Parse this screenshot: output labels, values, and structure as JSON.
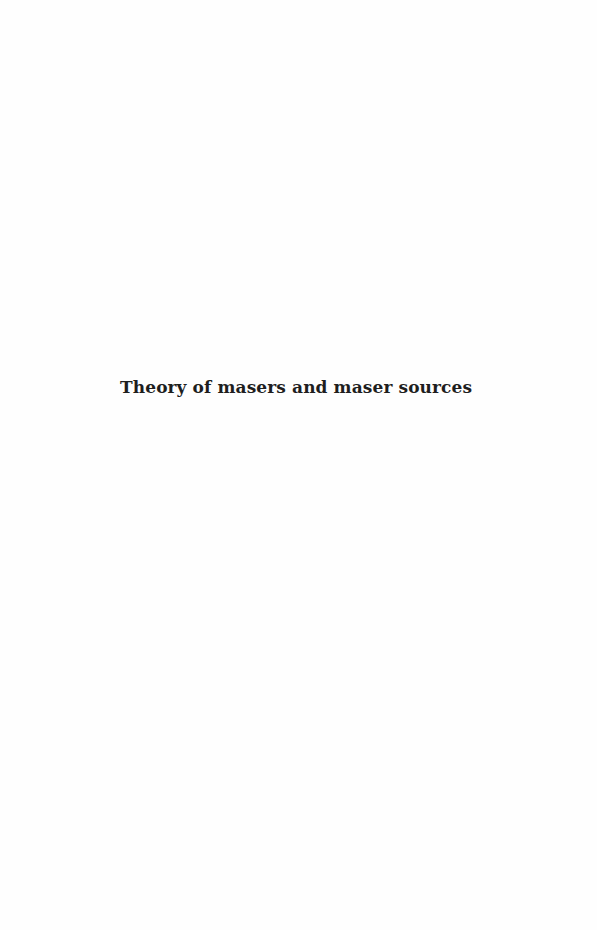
{
  "page": {
    "half_title": "Theory of masers and maser sources"
  }
}
